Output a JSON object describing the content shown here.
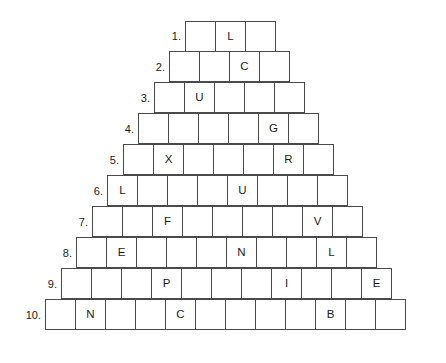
{
  "puzzle": {
    "type": "word-pyramid",
    "row_count": 10,
    "cell_size_px": 31,
    "rows": [
      {
        "number": "1.",
        "cell_count": 3,
        "left_px": 186,
        "top_px": 21,
        "letters": [
          "",
          "L",
          ""
        ]
      },
      {
        "number": "2.",
        "cell_count": 4,
        "left_px": 170,
        "top_px": 52,
        "letters": [
          "",
          "",
          "C",
          ""
        ]
      },
      {
        "number": "3.",
        "cell_count": 5,
        "left_px": 155,
        "top_px": 83,
        "letters": [
          "",
          "U",
          "",
          "",
          ""
        ]
      },
      {
        "number": "4.",
        "cell_count": 6,
        "left_px": 139,
        "top_px": 114,
        "letters": [
          "",
          "",
          "",
          "",
          "G",
          ""
        ]
      },
      {
        "number": "5.",
        "cell_count": 7,
        "left_px": 124,
        "top_px": 145,
        "letters": [
          "",
          "X",
          "",
          "",
          "",
          "R",
          ""
        ]
      },
      {
        "number": "6.",
        "cell_count": 8,
        "left_px": 108,
        "top_px": 176,
        "letters": [
          "L",
          "",
          "",
          "",
          "U",
          "",
          "",
          ""
        ]
      },
      {
        "number": "7.",
        "cell_count": 9,
        "left_px": 93,
        "top_px": 207,
        "letters": [
          "",
          "",
          "F",
          "",
          "",
          "",
          "",
          "V",
          ""
        ]
      },
      {
        "number": "8.",
        "cell_count": 10,
        "left_px": 77,
        "top_px": 238,
        "letters": [
          "",
          "E",
          "",
          "",
          "",
          "N",
          "",
          "",
          "L",
          ""
        ]
      },
      {
        "number": "9.",
        "cell_count": 11,
        "left_px": 62,
        "top_px": 269,
        "letters": [
          "",
          "",
          "",
          "P",
          "",
          "",
          "",
          "I",
          "",
          "",
          "E"
        ]
      },
      {
        "number": "10.",
        "cell_count": 12,
        "left_px": 46,
        "top_px": 300,
        "letters": [
          "",
          "N",
          "",
          "",
          "C",
          "",
          "",
          "",
          "",
          "B",
          "",
          ""
        ]
      }
    ]
  },
  "colors": {
    "background": "#ffffff",
    "cell_border": "#4a4a4a",
    "cell_fill": "#ffffff",
    "text": "#1a1a1a"
  }
}
